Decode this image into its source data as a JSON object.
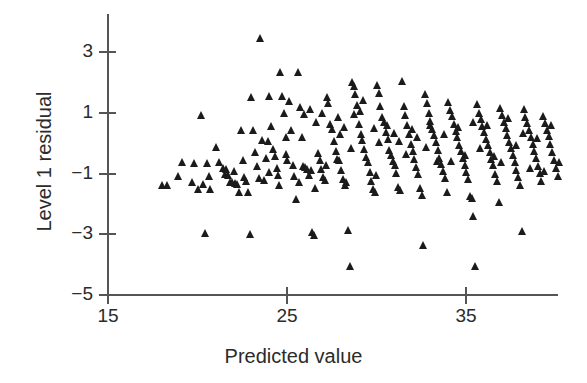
{
  "chart_data": {
    "type": "scatter",
    "title": "",
    "xlabel": "Predicted value",
    "ylabel": "Level 1 residual",
    "xlim": [
      15,
      40.3
    ],
    "ylim": [
      -5,
      3.9
    ],
    "xticks": [
      15,
      25,
      35
    ],
    "xtick_labels": [
      "15",
      "25",
      "35"
    ],
    "yticks": [
      3,
      1,
      -1,
      -3,
      -5
    ],
    "ytick_labels": [
      "3",
      "1",
      "−1",
      "−3",
      "−5"
    ],
    "grid": false,
    "legend": null,
    "marker": "triangle-up",
    "marker_color": "#1b1b1b",
    "axis_color": "#555555",
    "background": "#ffffff",
    "n_points": 236,
    "points": [
      [
        18.05,
        -1.37
      ],
      [
        18.35,
        -1.38
      ],
      [
        18.95,
        -1.1
      ],
      [
        19.15,
        -0.62
      ],
      [
        19.75,
        -1.27
      ],
      [
        19.85,
        -0.65
      ],
      [
        20.05,
        -1.52
      ],
      [
        20.25,
        0.92
      ],
      [
        20.35,
        -1.35
      ],
      [
        20.45,
        -2.98
      ],
      [
        20.55,
        -0.66
      ],
      [
        20.65,
        -1.1
      ],
      [
        20.75,
        -1.52
      ],
      [
        21.05,
        -0.12
      ],
      [
        21.25,
        -0.63
      ],
      [
        21.45,
        -0.82
      ],
      [
        21.55,
        -1.02
      ],
      [
        21.65,
        -0.86
      ],
      [
        21.75,
        -1.06
      ],
      [
        21.85,
        -1.28
      ],
      [
        21.95,
        -1.3
      ],
      [
        22.05,
        -0.93
      ],
      [
        22.15,
        -1.32
      ],
      [
        22.25,
        -1.36
      ],
      [
        22.35,
        -1.6
      ],
      [
        22.45,
        0.41
      ],
      [
        22.55,
        -0.56
      ],
      [
        22.65,
        -1.11
      ],
      [
        22.75,
        -1.26
      ],
      [
        22.85,
        -1.62
      ],
      [
        22.95,
        -2.99
      ],
      [
        23.05,
        1.52
      ],
      [
        23.15,
        0.44
      ],
      [
        23.25,
        -0.3
      ],
      [
        23.35,
        -0.75
      ],
      [
        23.45,
        -1.15
      ],
      [
        23.55,
        3.45
      ],
      [
        23.65,
        0.08
      ],
      [
        23.75,
        -1.21
      ],
      [
        23.85,
        -0.5
      ],
      [
        23.95,
        0.05
      ],
      [
        24.05,
        1.55
      ],
      [
        24.15,
        0.55
      ],
      [
        24.25,
        -0.19
      ],
      [
        24.35,
        -0.44
      ],
      [
        24.45,
        -0.81
      ],
      [
        24.55,
        -1.05
      ],
      [
        24.65,
        2.35
      ],
      [
        24.75,
        1.56
      ],
      [
        24.85,
        0.98
      ],
      [
        24.95,
        0.2
      ],
      [
        25.05,
        -0.55
      ],
      [
        25.15,
        1.37
      ],
      [
        25.25,
        0.41
      ],
      [
        25.35,
        -0.72
      ],
      [
        25.45,
        -1.08
      ],
      [
        25.55,
        -1.84
      ],
      [
        25.65,
        2.35
      ],
      [
        25.75,
        1.17
      ],
      [
        25.85,
        0.2
      ],
      [
        25.95,
        -0.77
      ],
      [
        26.05,
        -0.8
      ],
      [
        26.15,
        -0.85
      ],
      [
        26.25,
        -1.06
      ],
      [
        26.35,
        -0.9
      ],
      [
        26.45,
        -2.92
      ],
      [
        26.55,
        -3.02
      ],
      [
        26.65,
        0.7
      ],
      [
        26.75,
        -0.34
      ],
      [
        26.85,
        -0.55
      ],
      [
        26.95,
        -0.86
      ],
      [
        27.05,
        -1.13
      ],
      [
        27.15,
        -1.21
      ],
      [
        27.25,
        1.52
      ],
      [
        27.35,
        1.33
      ],
      [
        27.45,
        0.62
      ],
      [
        27.55,
        0.45
      ],
      [
        27.65,
        0.05
      ],
      [
        27.75,
        -0.27
      ],
      [
        27.85,
        -0.52
      ],
      [
        27.95,
        -0.57
      ],
      [
        28.05,
        -0.9
      ],
      [
        28.15,
        -1.18
      ],
      [
        28.25,
        -1.37
      ],
      [
        28.35,
        -1.3
      ],
      [
        28.45,
        -2.86
      ],
      [
        28.55,
        -4.05
      ],
      [
        28.65,
        2.0
      ],
      [
        28.75,
        1.86
      ],
      [
        28.85,
        1.6
      ],
      [
        28.95,
        1.25
      ],
      [
        29.05,
        0.62
      ],
      [
        29.15,
        0.3
      ],
      [
        29.25,
        0.1
      ],
      [
        29.35,
        -0.2
      ],
      [
        29.45,
        -0.46
      ],
      [
        29.55,
        -0.62
      ],
      [
        29.65,
        -0.95
      ],
      [
        29.75,
        -1.24
      ],
      [
        29.85,
        -1.52
      ],
      [
        29.95,
        -1.6
      ],
      [
        30.05,
        1.9
      ],
      [
        30.15,
        1.64
      ],
      [
        30.25,
        1.22
      ],
      [
        30.35,
        0.86
      ],
      [
        30.45,
        0.7
      ],
      [
        30.55,
        0.36
      ],
      [
        30.65,
        0.12
      ],
      [
        30.75,
        -0.22
      ],
      [
        30.85,
        -0.39
      ],
      [
        30.95,
        -0.6
      ],
      [
        31.05,
        -0.74
      ],
      [
        31.15,
        -0.98
      ],
      [
        31.25,
        -1.45
      ],
      [
        31.35,
        -1.56
      ],
      [
        31.45,
        2.05
      ],
      [
        31.55,
        1.2
      ],
      [
        31.65,
        0.92
      ],
      [
        31.75,
        0.6
      ],
      [
        31.85,
        0.28
      ],
      [
        31.95,
        -0.02
      ],
      [
        32.05,
        -0.28
      ],
      [
        32.15,
        -0.52
      ],
      [
        32.25,
        -0.78
      ],
      [
        32.35,
        -1.02
      ],
      [
        32.45,
        -1.5
      ],
      [
        32.55,
        -1.7
      ],
      [
        32.65,
        -3.36
      ],
      [
        32.75,
        1.6
      ],
      [
        32.85,
        1.3
      ],
      [
        32.95,
        0.98
      ],
      [
        33.05,
        0.72
      ],
      [
        33.15,
        0.46
      ],
      [
        33.25,
        0.26
      ],
      [
        33.35,
        0.02
      ],
      [
        33.45,
        -0.24
      ],
      [
        33.55,
        -0.48
      ],
      [
        33.65,
        -0.68
      ],
      [
        33.75,
        -0.94
      ],
      [
        33.85,
        -1.16
      ],
      [
        33.95,
        -1.62
      ],
      [
        34.05,
        1.35
      ],
      [
        34.15,
        1.1
      ],
      [
        34.25,
        0.88
      ],
      [
        34.35,
        0.62
      ],
      [
        34.45,
        0.4
      ],
      [
        34.55,
        0.18
      ],
      [
        34.65,
        -0.06
      ],
      [
        34.75,
        -0.28
      ],
      [
        34.85,
        -0.48
      ],
      [
        34.95,
        -0.72
      ],
      [
        35.05,
        -0.96
      ],
      [
        35.15,
        -1.2
      ],
      [
        35.25,
        -1.74
      ],
      [
        35.35,
        -1.8
      ],
      [
        35.45,
        -2.42
      ],
      [
        35.55,
        -4.06
      ],
      [
        35.65,
        1.28
      ],
      [
        35.75,
        1.0
      ],
      [
        35.85,
        0.78
      ],
      [
        35.95,
        0.56
      ],
      [
        36.05,
        0.36
      ],
      [
        36.15,
        0.14
      ],
      [
        36.25,
        -0.08
      ],
      [
        36.35,
        -0.3
      ],
      [
        36.45,
        -0.52
      ],
      [
        36.55,
        -0.74
      ],
      [
        36.65,
        -1.02
      ],
      [
        36.75,
        -1.26
      ],
      [
        36.85,
        -1.96
      ],
      [
        36.95,
        1.16
      ],
      [
        37.05,
        0.92
      ],
      [
        37.15,
        0.68
      ],
      [
        37.25,
        0.48
      ],
      [
        37.35,
        0.26
      ],
      [
        37.45,
        0.04
      ],
      [
        37.55,
        -0.18
      ],
      [
        37.65,
        -0.4
      ],
      [
        37.75,
        -0.64
      ],
      [
        37.85,
        -0.88
      ],
      [
        37.95,
        -1.12
      ],
      [
        38.05,
        -1.38
      ],
      [
        38.15,
        -2.9
      ],
      [
        38.25,
        1.12
      ],
      [
        38.35,
        0.86
      ],
      [
        38.45,
        0.64
      ],
      [
        38.55,
        0.42
      ],
      [
        38.65,
        0.2
      ],
      [
        38.75,
        -0.02
      ],
      [
        38.85,
        -0.26
      ],
      [
        38.95,
        -0.5
      ],
      [
        39.05,
        -0.76
      ],
      [
        39.15,
        -1.0
      ],
      [
        39.25,
        -1.24
      ],
      [
        39.35,
        0.88
      ],
      [
        39.45,
        0.66
      ],
      [
        39.55,
        0.44
      ],
      [
        39.65,
        0.22
      ],
      [
        39.75,
        -0.04
      ],
      [
        39.85,
        -0.3
      ],
      [
        39.95,
        -0.56
      ],
      [
        40.05,
        -0.82
      ],
      [
        40.15,
        -1.08
      ],
      [
        40.25,
        -0.62
      ],
      [
        26.0,
        0.95
      ],
      [
        26.3,
        1.12
      ],
      [
        27.0,
        1.0
      ],
      [
        27.9,
        0.85
      ],
      [
        28.2,
        0.52
      ],
      [
        28.8,
        0.95
      ],
      [
        29.1,
        1.05
      ],
      [
        29.9,
        0.48
      ],
      [
        30.2,
        0.02
      ],
      [
        30.6,
        0.58
      ],
      [
        31.0,
        0.34
      ],
      [
        31.3,
        0.06
      ],
      [
        31.7,
        -0.36
      ],
      [
        32.0,
        0.45
      ],
      [
        32.3,
        0.18
      ],
      [
        32.8,
        -0.14
      ],
      [
        33.0,
        0.58
      ],
      [
        33.4,
        -0.6
      ],
      [
        33.8,
        0.3
      ],
      [
        34.2,
        -0.6
      ],
      [
        34.6,
        0.52
      ],
      [
        35.0,
        -0.4
      ],
      [
        35.4,
        0.7
      ],
      [
        35.8,
        -0.18
      ],
      [
        36.2,
        0.58
      ],
      [
        36.6,
        -0.44
      ],
      [
        37.0,
        -0.62
      ],
      [
        37.4,
        0.82
      ],
      [
        37.8,
        -0.06
      ],
      [
        38.2,
        0.34
      ],
      [
        38.6,
        -0.82
      ],
      [
        39.0,
        0.16
      ],
      [
        39.4,
        -0.92
      ],
      [
        39.8,
        0.6
      ],
      [
        24.0,
        -0.95
      ],
      [
        24.6,
        -1.4
      ],
      [
        25.0,
        -0.38
      ],
      [
        25.7,
        -1.3
      ],
      [
        26.6,
        -1.48
      ],
      [
        27.2,
        -0.72
      ],
      [
        28.0,
        0.28
      ],
      [
        28.6,
        -0.18
      ],
      [
        29.3,
        1.4
      ],
      [
        30.0,
        -1.05
      ]
    ]
  },
  "axes": {
    "x_label": "Predicted value",
    "y_label": "Level 1 residual",
    "x_tick_labels": [
      "15",
      "25",
      "35"
    ],
    "y_tick_labels": [
      "3",
      "1",
      "−1",
      "−3",
      "−5"
    ]
  }
}
